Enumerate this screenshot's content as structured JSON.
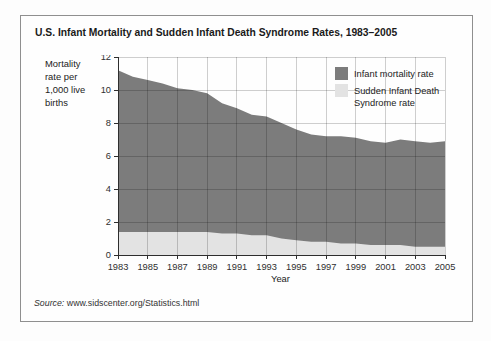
{
  "figure": {
    "title": "U.S. Infant Mortality and Sudden Infant Death Syndrome Rates, 1983–2005",
    "y_axis_label_lines": [
      "Mortality",
      "rate per",
      "1,000 live",
      "births"
    ],
    "x_axis_label": "Year",
    "source_prefix": "Source:",
    "source_text": " www.sidscenter.org/Statistics.html",
    "legend": [
      {
        "label": "Infant mortality rate",
        "lines": [
          "Infant mortality rate"
        ]
      },
      {
        "label": "Sudden Infant Death Syndrome rate",
        "lines": [
          "Sudden Infant Death",
          "Syndrome rate"
        ]
      }
    ]
  },
  "colors": {
    "infant_mortality_area": "#7c7c7c",
    "sids_area": "#e3e3e3",
    "gridline": "rgba(0,0,0,0.19)",
    "axis": "#2e2e2e",
    "frame_border": "#8f8f8f",
    "text": "#222222"
  },
  "chart_data": {
    "type": "area",
    "title": "U.S. Infant Mortality and Sudden Infant Death Syndrome Rates, 1983–2005",
    "xlabel": "Year",
    "ylabel": "Mortality rate per 1,000 live births",
    "x": [
      1983,
      1984,
      1985,
      1986,
      1987,
      1988,
      1989,
      1990,
      1991,
      1992,
      1993,
      1994,
      1995,
      1996,
      1997,
      1998,
      1999,
      2000,
      2001,
      2002,
      2003,
      2004,
      2005
    ],
    "series": [
      {
        "name": "Infant mortality rate",
        "color": "#7c7c7c",
        "values": [
          11.2,
          10.8,
          10.6,
          10.4,
          10.1,
          10.0,
          9.8,
          9.2,
          8.9,
          8.5,
          8.4,
          8.0,
          7.6,
          7.3,
          7.2,
          7.2,
          7.1,
          6.9,
          6.8,
          7.0,
          6.9,
          6.8,
          6.9
        ]
      },
      {
        "name": "Sudden Infant Death Syndrome rate",
        "color": "#e3e3e3",
        "values": [
          1.4,
          1.4,
          1.4,
          1.4,
          1.4,
          1.4,
          1.4,
          1.3,
          1.3,
          1.2,
          1.2,
          1.0,
          0.9,
          0.8,
          0.8,
          0.7,
          0.7,
          0.6,
          0.6,
          0.6,
          0.5,
          0.5,
          0.5
        ]
      }
    ],
    "ylim": [
      0,
      12
    ],
    "yticks": [
      0,
      2,
      4,
      6,
      8,
      10,
      12
    ],
    "xticks": [
      1983,
      1985,
      1987,
      1989,
      1991,
      1993,
      1995,
      1997,
      1999,
      2001,
      2003,
      2005
    ],
    "grid": true,
    "legend_position": "top-right"
  }
}
